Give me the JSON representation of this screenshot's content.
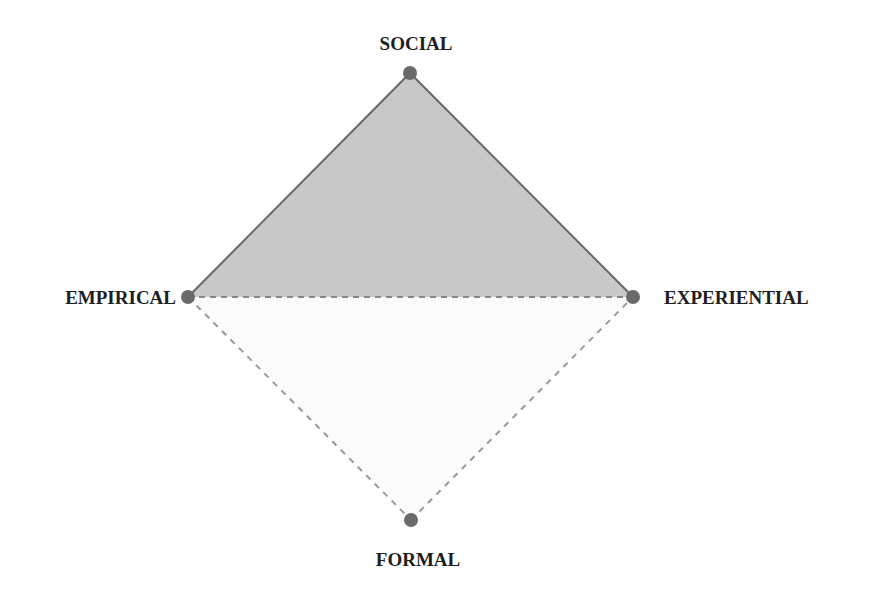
{
  "diagram": {
    "type": "diamond",
    "colors": {
      "upper_fill": "#c8c8c8",
      "lower_fill": "#fbfbfb",
      "solid_edge": "#666666",
      "dashed_edge": "#888888",
      "node": "#6a6a6a",
      "text": "#1e1e1e"
    },
    "nodes": [
      {
        "id": "social",
        "label": "SOCIAL",
        "x": 410,
        "y": 73
      },
      {
        "id": "empirical",
        "label": "EMPIRICAL",
        "x": 188,
        "y": 297
      },
      {
        "id": "experiential",
        "label": "EXPERIENTIAL",
        "x": 633,
        "y": 297
      },
      {
        "id": "formal",
        "label": "FORMAL",
        "x": 411,
        "y": 520
      }
    ],
    "edges": [
      {
        "from": "empirical",
        "to": "social",
        "style": "solid"
      },
      {
        "from": "social",
        "to": "experiential",
        "style": "solid"
      },
      {
        "from": "empirical",
        "to": "experiential",
        "style": "dashed"
      },
      {
        "from": "empirical",
        "to": "formal",
        "style": "dashed"
      },
      {
        "from": "formal",
        "to": "experiential",
        "style": "dashed"
      }
    ],
    "regions": [
      {
        "name": "upper-triangle",
        "vertices": [
          "empirical",
          "social",
          "experiential"
        ],
        "shaded": true
      },
      {
        "name": "lower-triangle",
        "vertices": [
          "empirical",
          "formal",
          "experiential"
        ],
        "shaded": false
      }
    ]
  }
}
